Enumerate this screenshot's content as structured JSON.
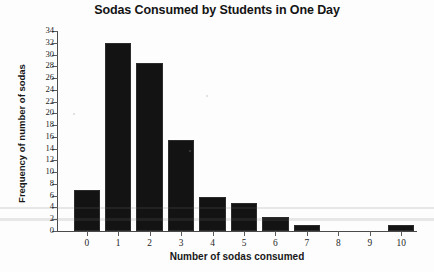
{
  "chart_data": {
    "type": "bar",
    "title": "Sodas Consumed by Students in One Day",
    "xlabel": "Number of sodas consumed",
    "ylabel": "Frequency of number of sodas",
    "categories": [
      "0",
      "1",
      "2",
      "3",
      "4",
      "5",
      "6",
      "7",
      "8",
      "9",
      "10"
    ],
    "values": [
      7,
      32,
      28.5,
      15.5,
      5.7,
      4.7,
      2.3,
      1,
      0,
      0,
      1
    ],
    "ylim": [
      0,
      34
    ],
    "xlim": [
      -0.6,
      10.6
    ],
    "y_ticks": [
      0,
      2,
      4,
      6,
      8,
      10,
      12,
      14,
      16,
      18,
      20,
      22,
      24,
      26,
      28,
      30,
      32,
      34
    ],
    "y_tick_labels": [
      "0",
      "2",
      "4",
      "6",
      "8",
      "10",
      "12",
      "14",
      "16",
      "18",
      "20",
      "22",
      "24",
      "26",
      "28",
      "30",
      "32",
      "34"
    ],
    "x_tick_labels": [
      "0",
      "1",
      "2",
      "3",
      "4",
      "5",
      "6",
      "7",
      "8",
      "9",
      "10"
    ],
    "grid": false,
    "legend": false,
    "bar_color": "#131313",
    "axis_color": "#4a4a4a",
    "background_color": "#fdfdfd"
  }
}
